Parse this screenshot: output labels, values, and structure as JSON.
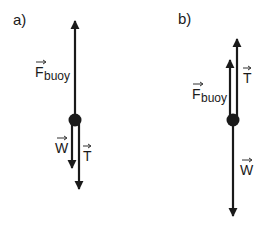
{
  "diagrams": [
    {
      "id": "a",
      "label": "a)",
      "forces": {
        "buoy": {
          "symbol": "F",
          "subscript": "buoy",
          "direction": "up"
        },
        "weight": {
          "symbol": "W",
          "direction": "down"
        },
        "tension": {
          "symbol": "T",
          "direction": "down"
        }
      }
    },
    {
      "id": "b",
      "label": "b)",
      "forces": {
        "buoy": {
          "symbol": "F",
          "subscript": "buoy",
          "direction": "up"
        },
        "tension": {
          "symbol": "T",
          "direction": "up"
        },
        "weight": {
          "symbol": "W",
          "direction": "down"
        }
      }
    }
  ],
  "colors": {
    "ink": "#1a1a1a",
    "background": "#ffffff"
  }
}
